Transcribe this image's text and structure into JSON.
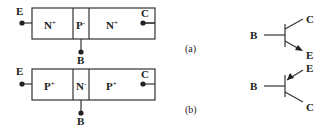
{
  "diagram_a": {
    "caption": "(a)",
    "regions": [
      {
        "type": "N",
        "doping": "+"
      },
      {
        "type": "P",
        "doping": "-"
      },
      {
        "type": "N",
        "doping": "+"
      }
    ],
    "terminals": {
      "emitter": "E",
      "base": "B",
      "collector": "C"
    },
    "symbol": {
      "base": "B",
      "collector": "C",
      "emitter": "E",
      "arrow": "outward"
    }
  },
  "diagram_b": {
    "caption": "(b)",
    "regions": [
      {
        "type": "P",
        "doping": "+"
      },
      {
        "type": "N",
        "doping": "-"
      },
      {
        "type": "P",
        "doping": "+"
      }
    ],
    "terminals": {
      "emitter": "E",
      "base": "B",
      "collector": "C"
    },
    "symbol": {
      "base": "B",
      "collector": "C",
      "emitter": "E",
      "arrow": "inward"
    }
  }
}
